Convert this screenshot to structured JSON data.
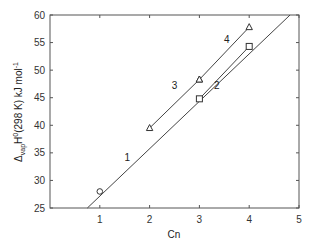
{
  "chart_data": {
    "type": "line",
    "title": "",
    "xlabel": "Cn",
    "ylabel": "Δvap H0(298 K) kJ mol-1",
    "ylabel_parts": {
      "delta": "Δ",
      "sub": "vap",
      "H": "H",
      "sup0": "0",
      "rest": "(298 K)  kJ mol",
      "sup": "-1"
    },
    "xlim": [
      0,
      5
    ],
    "ylim": [
      25,
      60
    ],
    "xticks": [
      1,
      2,
      3,
      4,
      5
    ],
    "yticks": [
      25,
      30,
      35,
      40,
      45,
      50,
      55,
      60
    ],
    "grid": false,
    "series": [
      {
        "name": "1",
        "marker": "none",
        "points": [
          [
            0.75,
            25
          ],
          [
            4.82,
            60
          ]
        ]
      },
      {
        "name": "circle",
        "marker": "circle",
        "points": [
          [
            1,
            28
          ]
        ]
      },
      {
        "name": "2",
        "marker": "square",
        "points": [
          [
            3,
            44.8
          ],
          [
            4,
            54.3
          ]
        ]
      },
      {
        "name": "3",
        "marker": "triangle",
        "points": [
          [
            2,
            39.5
          ],
          [
            3,
            48.3
          ]
        ]
      },
      {
        "name": "4",
        "marker": "triangle",
        "points": [
          [
            3,
            48.3
          ],
          [
            4,
            57.8
          ]
        ]
      }
    ],
    "annotations": [
      {
        "text": "1",
        "x": 1.55,
        "y": 33.5
      },
      {
        "text": "2",
        "x": 3.35,
        "y": 46.5
      },
      {
        "text": "3",
        "x": 2.5,
        "y": 46.5
      },
      {
        "text": "4",
        "x": 3.55,
        "y": 55
      }
    ]
  }
}
